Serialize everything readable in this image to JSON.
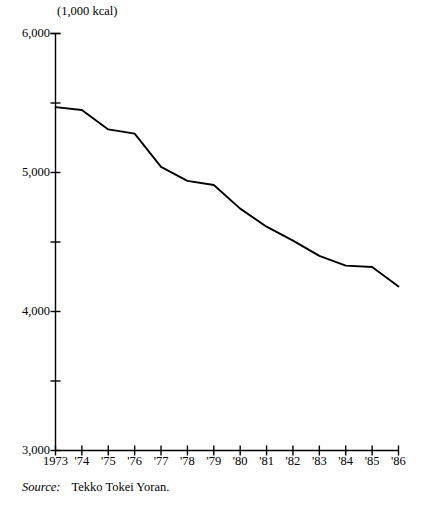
{
  "chart_data": {
    "type": "line",
    "title": "",
    "subtitle": "",
    "xlabel": "",
    "ylabel": "(1,000 kcal)",
    "unit_note": "(1,000 kcal)",
    "x": [
      1973,
      1974,
      1975,
      1976,
      1977,
      1978,
      1979,
      1980,
      1981,
      1982,
      1983,
      1984,
      1985,
      1986
    ],
    "categories": [
      "1973",
      "'74",
      "'75",
      "'76",
      "'77",
      "'78",
      "'79",
      "'80",
      "'81",
      "'82",
      "'83",
      "'84",
      "'85",
      "'86"
    ],
    "values": [
      5470,
      5450,
      5310,
      5280,
      5040,
      4940,
      4910,
      4740,
      4610,
      4510,
      4400,
      4330,
      4320,
      4180
    ],
    "series": [
      {
        "name": "Energy consumption per ton",
        "values": [
          5470,
          5450,
          5310,
          5280,
          5040,
          4940,
          4910,
          4740,
          4610,
          4510,
          4400,
          4330,
          4320,
          4180
        ]
      }
    ],
    "ylim": [
      3000,
      6000
    ],
    "ymajor_ticks": [
      3000,
      4000,
      5000,
      6000
    ],
    "yminor_ticks": [
      3500,
      4500,
      5500
    ],
    "ytick_labels": [
      "3,000",
      "4,000",
      "5,000",
      "6,000"
    ],
    "xlim": [
      1973,
      1986
    ],
    "xtick_labels": [
      "1973",
      "'74",
      "'75",
      "'76",
      "'77",
      "'78",
      "'79",
      "'80",
      "'81",
      "'82",
      "'83",
      "'84",
      "'85",
      "'86"
    ],
    "grid": false,
    "legend": "none",
    "line_color": "#000000",
    "axis_color": "#000000",
    "background_color": "#ffffff",
    "annotations": []
  },
  "source": {
    "label": "Source:",
    "text": "Tekko Tokei Yoran."
  }
}
